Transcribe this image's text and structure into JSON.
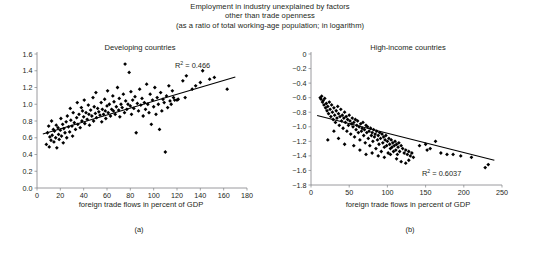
{
  "figure": {
    "supertitle_lines": [
      "Employment in industry unexplained by factors",
      "other than trade openness",
      "(as a ratio of total working-age population; in logarithm)"
    ]
  },
  "chart_data": [
    {
      "type": "scatter",
      "panel": "(a)",
      "title": "Developing countries",
      "xlabel": "foreign trade flows in percent of GDP",
      "ylabel": "",
      "xlim": [
        0,
        180
      ],
      "ylim": [
        0,
        1.6
      ],
      "xticks": [
        "0",
        "20",
        "40",
        "60",
        "80",
        "100",
        "120",
        "140",
        "160",
        "180"
      ],
      "yticks": [
        "0.0",
        "0.2",
        "0.4",
        "0.6",
        "0.8",
        "1.0",
        "1.2",
        "1.4",
        "1.6"
      ],
      "grid": false,
      "legend": "none",
      "annotation": "R2 = 0.466",
      "annotation_label": "R",
      "annotation_sup": "2",
      "annotation_value": "= 0.466",
      "r_squared": 0.466,
      "trendline": {
        "x": [
          5,
          170
        ],
        "y": [
          0.645,
          1.325
        ],
        "slope": 0.00412,
        "intercept": 0.6244
      },
      "points": [
        [
          8,
          0.52
        ],
        [
          9,
          0.66
        ],
        [
          10,
          0.74
        ],
        [
          10.5,
          0.49
        ],
        [
          11,
          0.61
        ],
        [
          12,
          0.57
        ],
        [
          12.5,
          0.8
        ],
        [
          13,
          0.63
        ],
        [
          14,
          0.7
        ],
        [
          14.5,
          0.55
        ],
        [
          15,
          0.68
        ],
        [
          16,
          0.6
        ],
        [
          16.5,
          0.75
        ],
        [
          17,
          0.48
        ],
        [
          18,
          0.72
        ],
        [
          18.5,
          0.64
        ],
        [
          19,
          0.58
        ],
        [
          20,
          0.69
        ],
        [
          20.5,
          0.83
        ],
        [
          21,
          0.62
        ],
        [
          22,
          0.76
        ],
        [
          22.5,
          0.54
        ],
        [
          23,
          0.71
        ],
        [
          24,
          0.66
        ],
        [
          25,
          0.79
        ],
        [
          25.5,
          0.6
        ],
        [
          26,
          0.86
        ],
        [
          27,
          0.73
        ],
        [
          28,
          0.67
        ],
        [
          28.5,
          0.95
        ],
        [
          29,
          0.81
        ],
        [
          30,
          0.74
        ],
        [
          30.5,
          0.62
        ],
        [
          31,
          0.9
        ],
        [
          32,
          0.78
        ],
        [
          33,
          0.7
        ],
        [
          34,
          0.84
        ],
        [
          34.5,
          1.02
        ],
        [
          35,
          0.76
        ],
        [
          36,
          0.88
        ],
        [
          37,
          0.72
        ],
        [
          38,
          0.96
        ],
        [
          38.5,
          0.8
        ],
        [
          39,
          0.92
        ],
        [
          40,
          0.85
        ],
        [
          40.5,
          1.05
        ],
        [
          41,
          0.77
        ],
        [
          42,
          0.9
        ],
        [
          43,
          0.82
        ],
        [
          44,
          0.99
        ],
        [
          44.5,
          0.88
        ],
        [
          45,
          0.75
        ],
        [
          46,
          0.93
        ],
        [
          47,
          0.86
        ],
        [
          48,
          1.08
        ],
        [
          48.5,
          0.8
        ],
        [
          49,
          0.97
        ],
        [
          50,
          0.89
        ],
        [
          50.5,
          1.14
        ],
        [
          51,
          0.84
        ],
        [
          52,
          0.95
        ],
        [
          53,
          0.91
        ],
        [
          54,
          0.87
        ],
        [
          55,
          1.02
        ],
        [
          55.5,
          0.79
        ],
        [
          56,
          0.94
        ],
        [
          57,
          0.88
        ],
        [
          58,
          1.06
        ],
        [
          58.5,
          0.92
        ],
        [
          59,
          0.83
        ],
        [
          60,
          0.98
        ],
        [
          60.5,
          1.16
        ],
        [
          61,
          0.9
        ],
        [
          62,
          1.0
        ],
        [
          63,
          0.86
        ],
        [
          64,
          0.94
        ],
        [
          65,
          1.1
        ],
        [
          65.5,
          0.92
        ],
        [
          66,
          1.03
        ],
        [
          67,
          0.88
        ],
        [
          68,
          0.97
        ],
        [
          69,
          1.2
        ],
        [
          70,
          0.93
        ],
        [
          70.5,
          1.07
        ],
        [
          71,
          0.85
        ],
        [
          72,
          1.0
        ],
        [
          73,
          0.96
        ],
        [
          74,
          1.12
        ],
        [
          75,
          0.9
        ],
        [
          75.5,
          1.48
        ],
        [
          76,
          1.04
        ],
        [
          77,
          0.94
        ],
        [
          78,
          1.0
        ],
        [
          79,
          1.38
        ],
        [
          80,
          0.98
        ],
        [
          80.5,
          1.15
        ],
        [
          81,
          0.88
        ],
        [
          82,
          1.05
        ],
        [
          83,
          0.95
        ],
        [
          84,
          1.09
        ],
        [
          85,
          0.66
        ],
        [
          86,
          1.01
        ],
        [
          87,
          0.92
        ],
        [
          88,
          1.18
        ],
        [
          89,
          0.99
        ],
        [
          90,
          1.07
        ],
        [
          91,
          0.86
        ],
        [
          92,
          1.02
        ],
        [
          93,
          0.94
        ],
        [
          94,
          1.24
        ],
        [
          95,
          1.0
        ],
        [
          96,
          0.9
        ],
        [
          97,
          1.12
        ],
        [
          98,
          0.76
        ],
        [
          99,
          1.05
        ],
        [
          100,
          0.97
        ],
        [
          101,
          1.2
        ],
        [
          102,
          0.88
        ],
        [
          103,
          1.08
        ],
        [
          104,
          1.0
        ],
        [
          105,
          0.7
        ],
        [
          106,
          1.14
        ],
        [
          107,
          0.92
        ],
        [
          108,
          1.06
        ],
        [
          109,
          1.02
        ],
        [
          110,
          0.43
        ],
        [
          111,
          1.1
        ],
        [
          112,
          0.96
        ],
        [
          113,
          1.22
        ],
        [
          114,
          1.04
        ],
        [
          115,
          1.0
        ],
        [
          116,
          1.16
        ],
        [
          117,
          1.08
        ],
        [
          118,
          1.05
        ],
        [
          120,
          1.05
        ],
        [
          121,
          1.06
        ],
        [
          125,
          1.28
        ],
        [
          127,
          1.08
        ],
        [
          128,
          1.34
        ],
        [
          133,
          1.18
        ],
        [
          136,
          1.22
        ],
        [
          140,
          1.26
        ],
        [
          142,
          1.4
        ],
        [
          148,
          1.3
        ],
        [
          152,
          1.32
        ],
        [
          163,
          1.18
        ]
      ]
    },
    {
      "type": "scatter",
      "panel": "(b)",
      "title": "High-income countries",
      "xlabel": "foreign trade flows in percent of GDP",
      "ylabel": "",
      "xlim": [
        0,
        250
      ],
      "ylim": [
        -1.8,
        0
      ],
      "xticks": [
        "0",
        "50",
        "100",
        "150",
        "200",
        "250"
      ],
      "yticks": [
        "0",
        "-0.2",
        "-0.4",
        "-0.6",
        "-0.8",
        "-1.0",
        "-1.2",
        "-1.4",
        "-1.6",
        "-1.8"
      ],
      "grid": false,
      "legend": "none",
      "annotation": "R2 = 0.6037",
      "annotation_label": "R",
      "annotation_sup": "2",
      "annotation_value": "= 0.6037",
      "r_squared": 0.6037,
      "trendline": {
        "x": [
          8,
          240
        ],
        "y": [
          -0.845,
          -1.46
        ],
        "slope": -0.00265,
        "intercept": -0.824
      },
      "points": [
        [
          12,
          -0.6
        ],
        [
          13,
          -0.62
        ],
        [
          14,
          -0.58
        ],
        [
          15,
          -0.66
        ],
        [
          16,
          -0.64
        ],
        [
          17,
          -0.7
        ],
        [
          18,
          -0.61
        ],
        [
          19,
          -0.74
        ],
        [
          20,
          -0.68
        ],
        [
          21,
          -0.78
        ],
        [
          22,
          -0.72
        ],
        [
          23,
          -0.82
        ],
        [
          24,
          -0.66
        ],
        [
          25,
          -0.76
        ],
        [
          26,
          -0.86
        ],
        [
          27,
          -0.7
        ],
        [
          28,
          -0.8
        ],
        [
          29,
          -0.9
        ],
        [
          30,
          -0.74
        ],
        [
          31,
          -0.84
        ],
        [
          32,
          -0.94
        ],
        [
          33,
          -0.78
        ],
        [
          34,
          -0.88
        ],
        [
          35,
          -0.72
        ],
        [
          36,
          -0.82
        ],
        [
          37,
          -0.98
        ],
        [
          38,
          -0.86
        ],
        [
          39,
          -0.76
        ],
        [
          40,
          -0.92
        ],
        [
          41,
          -0.84
        ],
        [
          42,
          -1.02
        ],
        [
          43,
          -0.88
        ],
        [
          44,
          -0.8
        ],
        [
          45,
          -0.94
        ],
        [
          46,
          -0.86
        ],
        [
          47,
          -1.06
        ],
        [
          48,
          -0.9
        ],
        [
          49,
          -0.98
        ],
        [
          50,
          -0.84
        ],
        [
          51,
          -0.92
        ],
        [
          52,
          -1.1
        ],
        [
          53,
          -0.96
        ],
        [
          54,
          -0.88
        ],
        [
          55,
          -1.0
        ],
        [
          56,
          -0.94
        ],
        [
          57,
          -1.14
        ],
        [
          58,
          -0.9
        ],
        [
          59,
          -1.04
        ],
        [
          60,
          -0.98
        ],
        [
          61,
          -0.92
        ],
        [
          62,
          -1.08
        ],
        [
          63,
          -1.0
        ],
        [
          64,
          -1.18
        ],
        [
          65,
          -0.96
        ],
        [
          66,
          -1.06
        ],
        [
          67,
          -1.02
        ],
        [
          68,
          -0.94
        ],
        [
          69,
          -1.12
        ],
        [
          70,
          -1.04
        ],
        [
          71,
          -1.22
        ],
        [
          72,
          -0.98
        ],
        [
          73,
          -1.08
        ],
        [
          74,
          -1.0
        ],
        [
          75,
          -1.16
        ],
        [
          76,
          -1.06
        ],
        [
          77,
          -1.26
        ],
        [
          78,
          -1.02
        ],
        [
          79,
          -1.12
        ],
        [
          80,
          -1.08
        ],
        [
          81,
          -1.2
        ],
        [
          82,
          -1.04
        ],
        [
          83,
          -1.14
        ],
        [
          84,
          -1.1
        ],
        [
          85,
          -1.3
        ],
        [
          86,
          -1.06
        ],
        [
          87,
          -1.18
        ],
        [
          88,
          -1.12
        ],
        [
          89,
          -1.24
        ],
        [
          90,
          -1.08
        ],
        [
          91,
          -1.16
        ],
        [
          92,
          -1.34
        ],
        [
          93,
          -1.1
        ],
        [
          94,
          -1.22
        ],
        [
          95,
          -1.14
        ],
        [
          96,
          -1.28
        ],
        [
          97,
          -1.18
        ],
        [
          98,
          -1.12
        ],
        [
          99,
          -1.26
        ],
        [
          100,
          -1.2
        ],
        [
          101,
          -1.36
        ],
        [
          102,
          -1.16
        ],
        [
          103,
          -1.24
        ],
        [
          104,
          -1.3
        ],
        [
          105,
          -1.18
        ],
        [
          106,
          -1.28
        ],
        [
          107,
          -1.22
        ],
        [
          108,
          -1.34
        ],
        [
          109,
          -1.26
        ],
        [
          110,
          -1.2
        ],
        [
          111,
          -1.32
        ],
        [
          112,
          -1.24
        ],
        [
          113,
          -1.38
        ],
        [
          114,
          -1.28
        ],
        [
          115,
          -1.22
        ],
        [
          116,
          -1.34
        ],
        [
          118,
          -1.26
        ],
        [
          120,
          -1.3
        ],
        [
          122,
          -1.36
        ],
        [
          124,
          -1.32
        ],
        [
          126,
          -1.38
        ],
        [
          128,
          -1.34
        ],
        [
          130,
          -1.4
        ],
        [
          132,
          -1.36
        ],
        [
          134,
          -1.42
        ],
        [
          22,
          -1.18
        ],
        [
          30,
          -1.06
        ],
        [
          36,
          -1.16
        ],
        [
          44,
          -1.24
        ],
        [
          56,
          -1.26
        ],
        [
          64,
          -1.32
        ],
        [
          72,
          -1.38
        ],
        [
          80,
          -1.36
        ],
        [
          88,
          -1.4
        ],
        [
          96,
          -1.42
        ],
        [
          104,
          -1.38
        ],
        [
          112,
          -1.44
        ],
        [
          142,
          -1.26
        ],
        [
          150,
          -1.24
        ],
        [
          152,
          -1.32
        ],
        [
          156,
          -1.3
        ],
        [
          163,
          -1.2
        ],
        [
          170,
          -1.36
        ],
        [
          178,
          -1.38
        ],
        [
          186,
          -1.38
        ],
        [
          196,
          -1.4
        ],
        [
          118,
          -1.48
        ],
        [
          124,
          -1.5
        ],
        [
          128,
          -1.46
        ],
        [
          210,
          -1.42
        ],
        [
          228,
          -1.56
        ],
        [
          232,
          -1.52
        ]
      ]
    }
  ]
}
